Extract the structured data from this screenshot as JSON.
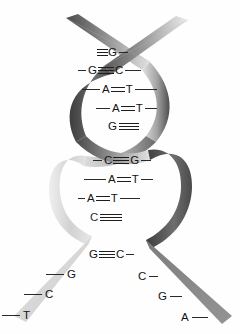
{
  "figure": {
    "background_color": "#fefefe",
    "strand_colors": {
      "light": "#d9d9d9",
      "mid": "#9a9a9a",
      "dark": "#4f4f4f",
      "darkest": "#3a3a3a"
    },
    "label_color": "#141414",
    "bond_color": "#1d1d1d"
  },
  "base_pairs": [
    {
      "left": "",
      "right": "G",
      "bond": "triple",
      "partial": "left-hidden",
      "x": 97,
      "y": 53
    },
    {
      "left": "G",
      "right": "C",
      "bond": "triple",
      "partial": "none",
      "x": 83,
      "y": 71
    },
    {
      "left": "A",
      "right": "T",
      "bond": "double",
      "partial": "none",
      "x": 86,
      "y": 90
    },
    {
      "left": "A",
      "right": "T",
      "bond": "double",
      "partial": "none",
      "x": 98,
      "y": 109
    },
    {
      "left": "G",
      "right": "",
      "bond": "triple",
      "partial": "right-hidden",
      "x": 108,
      "y": 127
    },
    {
      "left": "C",
      "right": "G",
      "bond": "triple",
      "partial": "none",
      "x": 98,
      "y": 161
    },
    {
      "left": "A",
      "right": "T",
      "bond": "double",
      "partial": "none",
      "x": 88,
      "y": 180
    },
    {
      "left": "A",
      "right": "T",
      "bond": "double",
      "partial": "none",
      "x": 82,
      "y": 199
    },
    {
      "left": "C",
      "right": "",
      "bond": "triple",
      "partial": "right-hidden",
      "x": 90,
      "y": 218
    },
    {
      "left": "G",
      "right": "C",
      "bond": "triple",
      "partial": "none",
      "x": 91,
      "y": 255
    }
  ],
  "single_bases": [
    {
      "letter": "G",
      "strand": "left",
      "x": 60,
      "y": 273,
      "lead": "left"
    },
    {
      "letter": "C",
      "strand": "left",
      "x": 38,
      "y": 293,
      "lead": "left"
    },
    {
      "letter": "T",
      "strand": "left",
      "x": 16,
      "y": 314,
      "lead": "left"
    },
    {
      "letter": "C",
      "strand": "right",
      "x": 140,
      "y": 275,
      "lead": "right"
    },
    {
      "letter": "G",
      "strand": "right",
      "x": 160,
      "y": 295,
      "lead": "right"
    },
    {
      "letter": "A",
      "strand": "right",
      "x": 183,
      "y": 316,
      "lead": "right"
    }
  ],
  "legend": {
    "triple_bond_symbol": "triple-bar",
    "double_bond_symbol": "double-bar"
  }
}
